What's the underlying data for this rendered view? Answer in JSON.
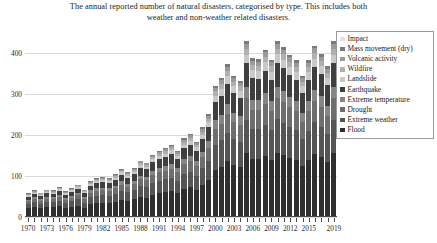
{
  "chart_data": {
    "type": "bar",
    "subtype": "stacked-bar",
    "title": "The annual reported number of natural disasters, categorised by type. This includes both weather and non-weather related disasters.",
    "title_line1": "The annual reported number of natural disasters, categorised by type. This includes both",
    "title_line2": "weather and non-weather related disasters.",
    "xlabel": "",
    "ylabel": "",
    "ylim": [
      0,
      430
    ],
    "yticks": [
      0,
      100,
      200,
      300,
      400
    ],
    "ytick_labels": [
      "0",
      "100",
      "200",
      "300",
      "400"
    ],
    "grid": true,
    "grid_axis": "y",
    "legend_position": "top-right",
    "x": [
      1970,
      1971,
      1972,
      1973,
      1974,
      1975,
      1976,
      1977,
      1978,
      1979,
      1980,
      1981,
      1982,
      1983,
      1984,
      1985,
      1986,
      1987,
      1988,
      1989,
      1990,
      1991,
      1992,
      1993,
      1994,
      1995,
      1996,
      1997,
      1998,
      1999,
      2000,
      2001,
      2002,
      2003,
      2004,
      2005,
      2006,
      2007,
      2008,
      2009,
      2010,
      2011,
      2012,
      2013,
      2014,
      2015,
      2016,
      2017,
      2018,
      2019
    ],
    "xtick_labels": [
      "1970",
      "1973",
      "1976",
      "1979",
      "1982",
      "1985",
      "1988",
      "1991",
      "1994",
      "1997",
      "2000",
      "2003",
      "2006",
      "2009",
      "2012",
      "2015",
      "2019"
    ],
    "xtick_values": [
      1970,
      1973,
      1976,
      1979,
      1982,
      1985,
      1988,
      1991,
      1994,
      1997,
      2000,
      2003,
      2006,
      2009,
      2012,
      2015,
      2019
    ],
    "series": [
      {
        "name": "Flood",
        "color": "#2f2f2f",
        "values": [
          21,
          24,
          21,
          24,
          24,
          26,
          22,
          25,
          28,
          22,
          31,
          34,
          34,
          34,
          37,
          42,
          39,
          43,
          49,
          47,
          55,
          58,
          60,
          63,
          58,
          69,
          73,
          66,
          78,
          90,
          116,
          123,
          136,
          126,
          121,
          159,
          142,
          141,
          149,
          140,
          162,
          152,
          145,
          140,
          125,
          139,
          153,
          146,
          134,
          170
        ]
      },
      {
        "name": "Extreme weather",
        "color": "#555555",
        "values": [
          10,
          12,
          11,
          12,
          12,
          14,
          12,
          13,
          15,
          13,
          17,
          18,
          19,
          18,
          20,
          22,
          21,
          23,
          26,
          26,
          29,
          31,
          32,
          33,
          31,
          36,
          38,
          35,
          41,
          47,
          60,
          64,
          70,
          65,
          63,
          82,
          73,
          73,
          77,
          72,
          84,
          78,
          75,
          72,
          65,
          72,
          79,
          75,
          69,
          88
        ]
      },
      {
        "name": "Drought",
        "color": "#6e6e6e",
        "values": [
          7,
          8,
          8,
          9,
          8,
          9,
          8,
          9,
          10,
          9,
          11,
          12,
          12,
          12,
          13,
          15,
          14,
          15,
          17,
          17,
          19,
          20,
          21,
          22,
          20,
          24,
          25,
          23,
          27,
          31,
          39,
          41,
          45,
          42,
          41,
          53,
          47,
          47,
          50,
          47,
          54,
          51,
          48,
          47,
          42,
          47,
          51,
          49,
          45,
          57
        ]
      },
      {
        "name": "Extreme temperature",
        "color": "#858585",
        "values": [
          4,
          4,
          4,
          5,
          4,
          5,
          4,
          5,
          5,
          5,
          6,
          6,
          7,
          6,
          7,
          8,
          7,
          8,
          9,
          9,
          10,
          11,
          11,
          12,
          11,
          13,
          13,
          12,
          14,
          17,
          21,
          22,
          24,
          22,
          22,
          28,
          25,
          25,
          27,
          25,
          29,
          27,
          26,
          25,
          23,
          25,
          27,
          26,
          24,
          30
        ]
      },
      {
        "name": "Earthquake",
        "color": "#3f3f3f",
        "values": [
          8,
          9,
          8,
          9,
          9,
          10,
          9,
          10,
          11,
          10,
          12,
          13,
          13,
          13,
          14,
          16,
          15,
          16,
          19,
          18,
          21,
          22,
          23,
          24,
          22,
          26,
          28,
          25,
          30,
          34,
          44,
          46,
          51,
          47,
          45,
          59,
          53,
          52,
          55,
          52,
          60,
          56,
          54,
          52,
          47,
          52,
          57,
          54,
          50,
          63
        ]
      },
      {
        "name": "Landslide",
        "color": "#c9c9c9",
        "values": [
          3,
          3,
          3,
          3,
          3,
          4,
          3,
          3,
          4,
          3,
          4,
          5,
          5,
          5,
          5,
          6,
          5,
          6,
          7,
          6,
          7,
          8,
          8,
          9,
          8,
          9,
          10,
          9,
          11,
          12,
          16,
          17,
          18,
          17,
          16,
          21,
          19,
          19,
          20,
          19,
          21,
          20,
          19,
          18,
          17,
          19,
          20,
          19,
          18,
          23
        ]
      },
      {
        "name": "Wildfire",
        "color": "#b0b0b0",
        "values": [
          2,
          2,
          2,
          2,
          2,
          2,
          2,
          2,
          3,
          2,
          3,
          3,
          3,
          3,
          4,
          4,
          4,
          4,
          5,
          4,
          5,
          5,
          6,
          6,
          5,
          7,
          7,
          6,
          8,
          9,
          11,
          12,
          13,
          12,
          11,
          15,
          13,
          13,
          14,
          13,
          15,
          14,
          13,
          13,
          12,
          13,
          14,
          13,
          12,
          16
        ]
      },
      {
        "name": "Volcanic activity",
        "color": "#9a9a9a",
        "values": [
          2,
          2,
          2,
          2,
          2,
          2,
          2,
          2,
          2,
          2,
          2,
          3,
          3,
          3,
          3,
          3,
          3,
          3,
          4,
          4,
          4,
          4,
          5,
          5,
          4,
          5,
          6,
          5,
          6,
          7,
          9,
          9,
          10,
          9,
          9,
          12,
          10,
          10,
          11,
          10,
          12,
          11,
          10,
          10,
          9,
          10,
          11,
          10,
          10,
          13
        ]
      },
      {
        "name": "Mass movement (dry)",
        "color": "#7a7a7a",
        "values": [
          1,
          1,
          1,
          1,
          1,
          1,
          1,
          1,
          1,
          1,
          1,
          2,
          2,
          2,
          2,
          2,
          2,
          2,
          2,
          2,
          2,
          3,
          3,
          3,
          3,
          3,
          3,
          3,
          4,
          4,
          5,
          5,
          6,
          5,
          5,
          7,
          6,
          6,
          6,
          6,
          7,
          6,
          6,
          6,
          5,
          6,
          6,
          6,
          6,
          7
        ]
      },
      {
        "name": "Impact",
        "color": "#e2e2e2",
        "values": [
          0,
          0,
          0,
          0,
          0,
          0,
          0,
          0,
          0,
          0,
          0,
          0,
          0,
          0,
          0,
          0,
          0,
          0,
          0,
          0,
          0,
          0,
          0,
          0,
          0,
          0,
          0,
          0,
          0,
          0,
          0,
          0,
          0,
          0,
          0,
          0,
          0,
          0,
          0,
          0,
          0,
          0,
          0,
          0,
          0,
          0,
          0,
          0,
          0,
          0
        ]
      }
    ],
    "totals": [
      58,
      65,
      60,
      67,
      65,
      73,
      63,
      70,
      79,
      67,
      87,
      96,
      98,
      96,
      105,
      118,
      110,
      120,
      138,
      133,
      152,
      162,
      169,
      177,
      162,
      192,
      203,
      184,
      219,
      251,
      321,
      339,
      373,
      345,
      333,
      436,
      388,
      386,
      409,
      384,
      444,
      415,
      396,
      383,
      345,
      383,
      418,
      398,
      368,
      467
    ]
  },
  "legend": {
    "items": [
      {
        "label": "Impact",
        "color": "#e2e2e2"
      },
      {
        "label": "Mass movement (dry)",
        "color": "#7a7a7a"
      },
      {
        "label": "Volcanic activity",
        "color": "#9a9a9a"
      },
      {
        "label": "Wildfire",
        "color": "#b0b0b0"
      },
      {
        "label": "Landslide",
        "color": "#c9c9c9"
      },
      {
        "label": "Earthquake",
        "color": "#3f3f3f"
      },
      {
        "label": "Extreme temperature",
        "color": "#858585"
      },
      {
        "label": "Drought",
        "color": "#6e6e6e"
      },
      {
        "label": "Extreme weather",
        "color": "#555555"
      },
      {
        "label": "Flood",
        "color": "#2f2f2f"
      }
    ]
  }
}
